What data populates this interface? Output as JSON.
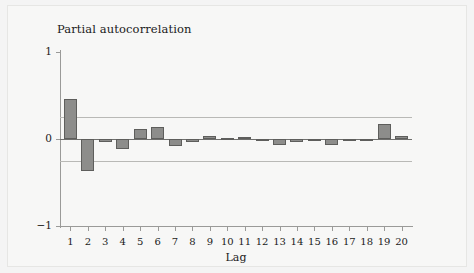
{
  "chart_data": {
    "type": "bar",
    "title": "Partial autocorrelation",
    "xlabel": "Lag",
    "ylabel": "",
    "ylim": [
      -1,
      1
    ],
    "xlim": [
      0.4,
      20.6
    ],
    "grid": false,
    "legend": null,
    "y_ticks": [
      "1",
      "0",
      "-1"
    ],
    "y_tick_values": [
      1,
      0,
      -1
    ],
    "categories": [
      1,
      2,
      3,
      4,
      5,
      6,
      7,
      8,
      9,
      10,
      11,
      12,
      13,
      14,
      15,
      16,
      17,
      18,
      19,
      20
    ],
    "x_tick_labels": [
      "1",
      "2",
      "3",
      "4",
      "5",
      "6",
      "7",
      "8",
      "9",
      "10",
      "11",
      "12",
      "13",
      "14",
      "15",
      "16",
      "17",
      "18",
      "19",
      "20"
    ],
    "values": [
      0.46,
      -0.37,
      -0.04,
      -0.12,
      0.11,
      0.14,
      -0.08,
      -0.03,
      0.04,
      0.01,
      0.02,
      -0.01,
      -0.07,
      -0.04,
      -0.01,
      -0.07,
      -0.02,
      -0.01,
      0.17,
      0.04
    ],
    "annotations": [
      {
        "name": "upper-confidence-band",
        "value": 0.25
      },
      {
        "name": "lower-confidence-band",
        "value": -0.25
      },
      {
        "name": "zero-reference-line",
        "value": 0
      }
    ],
    "colors": {
      "bar_fill": "#8d8d8b",
      "bar_border": "#5e5e5c",
      "confidence_band": "#b9b9b6",
      "zero_line": "#6f6f6d",
      "axis": "#9a9a98",
      "background": "#f7f7f6",
      "text": "#1a1a1a"
    }
  }
}
